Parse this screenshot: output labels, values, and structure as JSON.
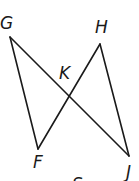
{
  "diagram": {
    "type": "geometry",
    "points": {
      "G": {
        "label": "G",
        "x": 10,
        "y": 37
      },
      "H": {
        "label": "H",
        "x": 100,
        "y": 44
      },
      "F": {
        "label": "F",
        "x": 38,
        "y": 149
      },
      "J": {
        "label": "J",
        "x": 129,
        "y": 156
      },
      "K": {
        "label": "K",
        "x": 69,
        "y": 96
      }
    },
    "segments": [
      "GF",
      "GJ",
      "FH",
      "HJ"
    ],
    "labels": {
      "G": "G",
      "H": "H",
      "K": "K",
      "F": "F",
      "J": "J",
      "partial_bottom": "S"
    },
    "stroke_color": "#1a1a1a",
    "background": "#ffffff"
  }
}
